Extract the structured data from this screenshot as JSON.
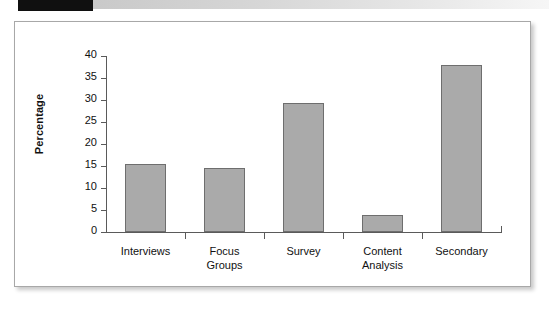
{
  "chart_data": {
    "type": "bar",
    "title": "",
    "subtitle": "",
    "xlabel": "",
    "ylabel": "Percentage",
    "ylim": [
      0,
      40
    ],
    "yticks": [
      0,
      5,
      10,
      15,
      20,
      25,
      30,
      35,
      40
    ],
    "ytick_labels": [
      "0",
      "5",
      "10",
      "15",
      "20",
      "25",
      "30",
      "35",
      "40"
    ],
    "grid": false,
    "legend": false,
    "categories": [
      "Interviews",
      "Focus Groups",
      "Survey",
      "Content Analysis",
      "Secondary"
    ],
    "category_label_lines": [
      [
        "Interviews"
      ],
      [
        "Focus",
        "Groups"
      ],
      [
        "Survey"
      ],
      [
        "Content",
        "Analysis"
      ],
      [
        "Secondary"
      ]
    ],
    "values": [
      15.5,
      14.6,
      29.3,
      3.9,
      37.9
    ],
    "bar_fill_color": "#aaaaaa",
    "bar_border_color": "#6e6e6e",
    "axis_color": "#5a5a5a"
  },
  "decoration": {
    "band_black_color": "#101010",
    "band_gradient_from": "#c9c9c9",
    "band_gradient_to": "#f6f6f6",
    "frame_border_color": "#a8a8a8",
    "background_color": "#ffffff"
  }
}
